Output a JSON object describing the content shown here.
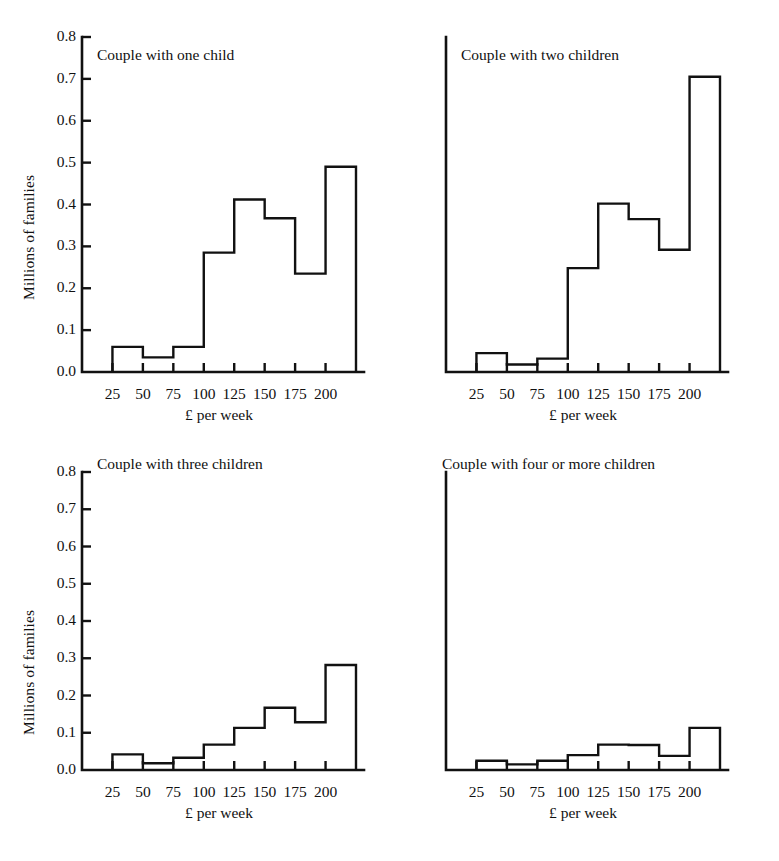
{
  "figure": {
    "background_color": "#ffffff",
    "ink_color": "#111111",
    "panel_count": 4
  },
  "axes": {
    "y_label": "Millions of families",
    "y_ticks": [
      "0.0",
      "0.1",
      "0.2",
      "0.3",
      "0.4",
      "0.5",
      "0.6",
      "0.7",
      "0.8"
    ],
    "y_min": 0.0,
    "y_max": 0.8,
    "x_label": "£ per week",
    "x_ticks": [
      "25",
      "50",
      "75",
      "100",
      "125",
      "150",
      "175",
      "200"
    ],
    "x_min": 0,
    "x_max": 225
  },
  "panels": [
    {
      "id": "one-child",
      "title": "Couple with one child"
    },
    {
      "id": "two-children",
      "title": "Couple with two children"
    },
    {
      "id": "three-children",
      "title": "Couple with three children"
    },
    {
      "id": "four-or-more-children",
      "title": "Couple with four or more children"
    }
  ],
  "chart_data": [
    {
      "type": "bar",
      "title": "Couple with one child",
      "xlabel": "£ per week",
      "ylabel": "Millions of families",
      "xlim": [
        0,
        225
      ],
      "ylim": [
        0.0,
        0.8
      ],
      "grid": false,
      "legend": "none",
      "bin_edges": [
        25,
        50,
        75,
        100,
        125,
        150,
        175,
        200,
        225
      ],
      "categories": [
        "25-50",
        "50-75",
        "75-100",
        "100-125",
        "125-150",
        "150-175",
        "175-200",
        "200+"
      ],
      "values": [
        0.06,
        0.035,
        0.06,
        0.285,
        0.412,
        0.367,
        0.235,
        0.49
      ],
      "open_ended_last_bin": true,
      "notes": "Last class (200+) drawn as an open-ended spike of unit width at the right edge."
    },
    {
      "type": "bar",
      "title": "Couple with two children",
      "xlabel": "£ per week",
      "ylabel": "Millions of families",
      "xlim": [
        0,
        225
      ],
      "ylim": [
        0.0,
        0.8
      ],
      "grid": false,
      "legend": "none",
      "bin_edges": [
        25,
        50,
        75,
        100,
        125,
        150,
        175,
        200,
        225
      ],
      "categories": [
        "25-50",
        "50-75",
        "75-100",
        "100-125",
        "125-150",
        "150-175",
        "175-200",
        "200+"
      ],
      "values": [
        0.045,
        0.018,
        0.032,
        0.248,
        0.402,
        0.365,
        0.292,
        0.705
      ],
      "open_ended_last_bin": true,
      "notes": "Last class (200+) drawn as an open-ended spike of unit width at the right edge."
    },
    {
      "type": "bar",
      "title": "Couple with three children",
      "xlabel": "£ per week",
      "ylabel": "Millions of families",
      "xlim": [
        0,
        225
      ],
      "ylim": [
        0.0,
        0.8
      ],
      "grid": false,
      "legend": "none",
      "bin_edges": [
        25,
        50,
        75,
        100,
        125,
        150,
        175,
        200,
        225
      ],
      "categories": [
        "25-50",
        "50-75",
        "75-100",
        "100-125",
        "125-150",
        "150-175",
        "175-200",
        "200+"
      ],
      "values": [
        0.042,
        0.018,
        0.033,
        0.068,
        0.113,
        0.167,
        0.128,
        0.282
      ],
      "open_ended_last_bin": true,
      "notes": "Last class (200+) drawn as an open-ended spike of unit width at the right edge."
    },
    {
      "type": "bar",
      "title": "Couple with four or more children",
      "xlabel": "£ per week",
      "ylabel": "Millions of families",
      "xlim": [
        0,
        225
      ],
      "ylim": [
        0.0,
        0.8
      ],
      "grid": false,
      "legend": "none",
      "bin_edges": [
        25,
        50,
        75,
        100,
        125,
        150,
        175,
        200,
        225
      ],
      "categories": [
        "25-50",
        "50-75",
        "75-100",
        "100-125",
        "125-150",
        "150-175",
        "175-200",
        "200+"
      ],
      "values": [
        0.025,
        0.015,
        0.025,
        0.04,
        0.068,
        0.067,
        0.038,
        0.113
      ],
      "open_ended_last_bin": true,
      "notes": "Last class (200+) drawn as an open-ended spike of unit width at the right edge."
    }
  ]
}
